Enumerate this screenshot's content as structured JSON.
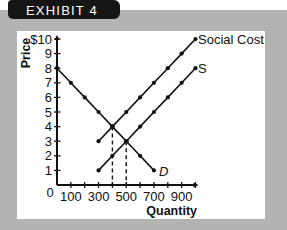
{
  "exhibit": {
    "label": "EXHIBIT 4"
  },
  "colors": {
    "band": "#b3b3b3",
    "tab": "#151515",
    "panel": "#ffffff",
    "ink": "#111111"
  },
  "chart_data": {
    "type": "line",
    "title": "EXHIBIT 4",
    "xlabel": "Quantity",
    "ylabel": "Price",
    "xlim": [
      0,
      1000
    ],
    "ylim": [
      0,
      10
    ],
    "grid": false,
    "legend": "inline labels at line ends",
    "origin_label": "0",
    "x_ticks": [
      100,
      200,
      300,
      400,
      500,
      600,
      700,
      800,
      900,
      1000
    ],
    "x_tick_labels": [
      {
        "x": 100,
        "label": "100"
      },
      {
        "x": 300,
        "label": "300"
      },
      {
        "x": 500,
        "label": "500"
      },
      {
        "x": 700,
        "label": "700"
      },
      {
        "x": 900,
        "label": "900"
      }
    ],
    "y_ticks": [
      1,
      2,
      3,
      4,
      5,
      6,
      7,
      8,
      9,
      10
    ],
    "y_tick_labels": [
      {
        "y": 1,
        "label": "1"
      },
      {
        "y": 2,
        "label": "2"
      },
      {
        "y": 3,
        "label": "3"
      },
      {
        "y": 4,
        "label": "4"
      },
      {
        "y": 5,
        "label": "5"
      },
      {
        "y": 6,
        "label": "6"
      },
      {
        "y": 7,
        "label": "7"
      },
      {
        "y": 8,
        "label": "8"
      },
      {
        "y": 9,
        "label": "9"
      },
      {
        "y": 10,
        "label": "$10"
      }
    ],
    "series": [
      {
        "name": "Social Cost",
        "label_style": "normal",
        "x": [
          300,
          400,
          500,
          600,
          700,
          800,
          900,
          1000
        ],
        "y": [
          3,
          4,
          5,
          6,
          7,
          8,
          9,
          10
        ]
      },
      {
        "name": "S",
        "label_style": "normal",
        "x": [
          300,
          400,
          500,
          600,
          700,
          800,
          900,
          1000
        ],
        "y": [
          1,
          2,
          3,
          4,
          5,
          6,
          7,
          8
        ]
      },
      {
        "name": "D",
        "label_style": "italic",
        "x": [
          0,
          100,
          200,
          300,
          400,
          500,
          600,
          700
        ],
        "y": [
          8,
          7,
          6,
          5,
          4,
          3,
          2,
          1
        ]
      }
    ],
    "annotations": [
      {
        "type": "dashed-drop-line",
        "x": 400,
        "y": 4,
        "note": "Demand meets Social Cost"
      },
      {
        "type": "dashed-drop-line",
        "x": 500,
        "y": 3,
        "note": "Demand meets Supply"
      }
    ]
  }
}
